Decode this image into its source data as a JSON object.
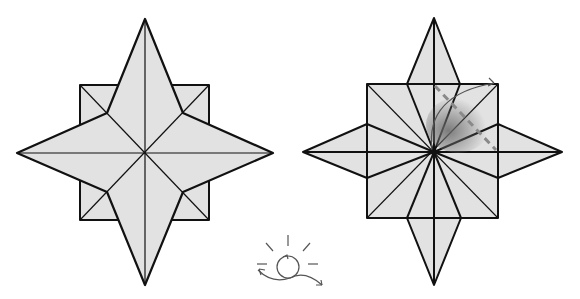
{
  "colors": {
    "paper": "#e2e2e2",
    "line": "#111111",
    "dash": "#8a8a8a",
    "symbol": "#555555"
  },
  "steps": [
    {
      "id": "step-a",
      "description": "Completed eight-point star, front view"
    },
    {
      "id": "step-b",
      "description": "Square base with four diamond points; valley fold indicated by dashed line and curved arrow"
    }
  ],
  "symbols": [
    {
      "name": "turn-over-icon",
      "description": "Sun-like circle with arrows indicating turn the model over"
    }
  ]
}
